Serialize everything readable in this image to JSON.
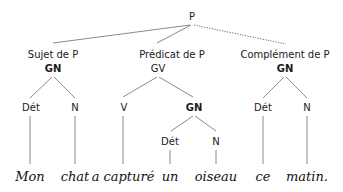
{
  "diagram": {
    "type": "syntax-tree",
    "root": {
      "label": "P"
    },
    "functions": [
      {
        "function": "Sujet de P",
        "category": "GN",
        "category_bold": true
      },
      {
        "function": "Prédicat de P",
        "category": "GV",
        "category_bold": false
      },
      {
        "function": "Complément de P",
        "category": "GN",
        "category_bold": true,
        "link_style": "dotted"
      }
    ],
    "level3": {
      "subject_det": "Dét",
      "subject_n": "N",
      "predicate_v": "V",
      "predicate_gn": "GN",
      "complement_det": "Dét",
      "complement_n": "N"
    },
    "level4": {
      "object_det": "Dét",
      "object_n": "N"
    },
    "words": [
      "Mon",
      "chat",
      "a capturé",
      "un",
      "oiseau",
      "ce",
      "matin."
    ]
  }
}
